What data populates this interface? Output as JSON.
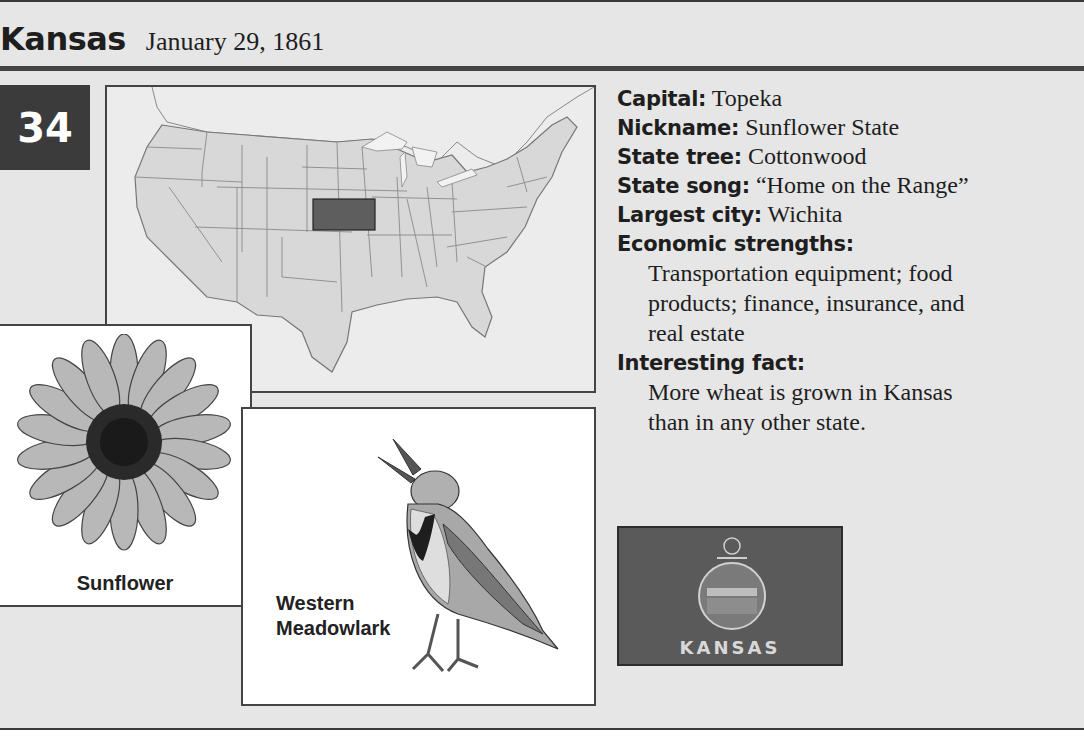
{
  "header": {
    "state_name": "Kansas",
    "admission_date": "January 29, 1861",
    "state_number": "34"
  },
  "map": {
    "highlighted_state": "Kansas",
    "highlight_color": "#5e5e5e",
    "base_color": "#d8d8d8"
  },
  "images": {
    "flower_label": "Sunflower",
    "bird_label_line1": "Western",
    "bird_label_line2": "Meadowlark",
    "flag_text": "KANSAS"
  },
  "facts": {
    "capital_label": "Capital:",
    "capital": "Topeka",
    "nickname_label": "Nickname:",
    "nickname": "Sunflower State",
    "tree_label": "State tree:",
    "tree": "Cottonwood",
    "song_label": "State song:",
    "song": "“Home on the Range”",
    "city_label": "Largest city:",
    "city": "Wichita",
    "economy_label": "Economic strengths:",
    "economy_line1": "Transportation equipment; food",
    "economy_line2": "products; finance, insurance, and",
    "economy_line3": "real estate",
    "fact_label": "Interesting fact:",
    "fact_line1": "More wheat is grown in Kansas",
    "fact_line2": "than in any other state."
  }
}
